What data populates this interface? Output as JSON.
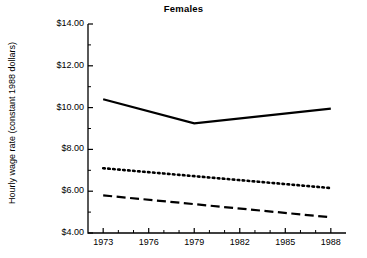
{
  "chart_data": {
    "type": "line",
    "title": "Females",
    "xlabel": "",
    "ylabel": "Hourly wage rate (constant 1988 dollars)",
    "x": [
      1973,
      1979,
      1988
    ],
    "xlim": [
      1972,
      1989
    ],
    "ylim": [
      4.0,
      14.0
    ],
    "grid": false,
    "legend": "none",
    "x_tick_labels": [
      "1973",
      "1976",
      "1979",
      "1982",
      "1985",
      "1988"
    ],
    "x_tick_values": [
      1973,
      1976,
      1979,
      1982,
      1985,
      1988
    ],
    "y_tick_labels": [
      "$14.00",
      "$12.00",
      "$10.00",
      "$8.00",
      "$6.00",
      "$4.00"
    ],
    "y_tick_values": [
      14.0,
      12.0,
      10.0,
      8.0,
      6.0,
      4.0
    ],
    "y_minor_tick_values": [
      13.0,
      11.0,
      9.0,
      7.0,
      5.0
    ],
    "series": [
      {
        "name": "solid-line",
        "style": "solid",
        "color": "#000000",
        "x": [
          1973,
          1979,
          1988
        ],
        "values": [
          10.4,
          9.25,
          9.95
        ]
      },
      {
        "name": "dotted-line",
        "style": "dotted",
        "color": "#000000",
        "x": [
          1973,
          1988
        ],
        "values": [
          7.1,
          6.15
        ]
      },
      {
        "name": "dashed-line",
        "style": "dashed",
        "color": "#000000",
        "x": [
          1973,
          1988
        ],
        "values": [
          5.8,
          4.75
        ]
      }
    ]
  }
}
